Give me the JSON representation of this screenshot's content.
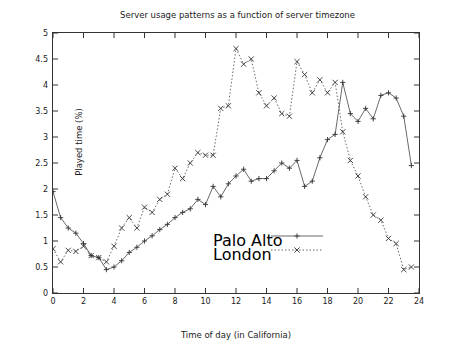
{
  "chart_data": {
    "type": "line",
    "title": "Server usage patterns as a function of server timezone",
    "xlabel": "Time of day (in California)",
    "ylabel": "Played time (%)",
    "xlim": [
      0,
      24
    ],
    "ylim": [
      0,
      5
    ],
    "xticks": [
      "0",
      "2",
      "4",
      "6",
      "8",
      "10",
      "12",
      "14",
      "16",
      "18",
      "20",
      "22",
      "24"
    ],
    "yticks": [
      "0",
      "0.5",
      "1",
      "1.5",
      "2",
      "2.5",
      "3",
      "3.5",
      "4",
      "4.5",
      "5"
    ],
    "grid": false,
    "legend_position": "center",
    "x": [
      0,
      0.5,
      1,
      1.5,
      2,
      2.5,
      3,
      3.5,
      4,
      4.5,
      5,
      5.5,
      6,
      6.5,
      7,
      7.5,
      8,
      8.5,
      9,
      9.5,
      10,
      10.5,
      11,
      11.5,
      12,
      12.5,
      13,
      13.5,
      14,
      14.5,
      15,
      15.5,
      16,
      16.5,
      17,
      17.5,
      18,
      18.5,
      19,
      19.5,
      20,
      20.5,
      21,
      21.5,
      22,
      22.5,
      23,
      23.5
    ],
    "series": [
      {
        "name": "Palo Alto",
        "marker": "plus",
        "linestyle": "solid",
        "values": [
          1.95,
          1.45,
          1.25,
          1.15,
          0.95,
          0.72,
          0.68,
          0.45,
          0.5,
          0.62,
          0.78,
          0.88,
          1.0,
          1.1,
          1.22,
          1.32,
          1.45,
          1.55,
          1.62,
          1.8,
          1.7,
          2.05,
          1.85,
          2.1,
          2.25,
          2.38,
          2.15,
          2.2,
          2.2,
          2.35,
          2.5,
          2.4,
          2.55,
          2.05,
          2.15,
          2.6,
          2.95,
          3.05,
          4.05,
          3.45,
          3.3,
          3.55,
          3.35,
          3.8,
          3.85,
          3.75,
          3.4,
          2.45
        ]
      },
      {
        "name": "London",
        "marker": "cross",
        "linestyle": "dotted",
        "values": [
          0.85,
          0.6,
          0.82,
          0.8,
          0.9,
          0.72,
          0.68,
          0.6,
          0.9,
          1.25,
          1.45,
          1.25,
          1.65,
          1.55,
          1.8,
          1.9,
          2.4,
          2.2,
          2.5,
          2.7,
          2.65,
          2.65,
          3.55,
          3.6,
          4.7,
          4.4,
          4.5,
          3.85,
          3.6,
          3.75,
          3.45,
          3.4,
          4.45,
          4.2,
          3.85,
          4.1,
          3.85,
          4.05,
          3.1,
          2.55,
          2.25,
          1.85,
          1.5,
          1.4,
          1.05,
          0.95,
          0.45,
          0.5
        ]
      }
    ]
  },
  "legend": {
    "items": [
      {
        "label": "Palo Alto"
      },
      {
        "label": "London"
      }
    ]
  }
}
